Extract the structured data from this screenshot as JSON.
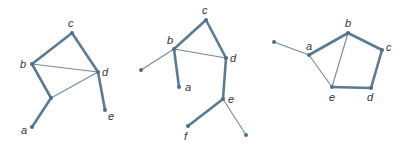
{
  "chart_data": {
    "type": "diagram",
    "graphs": [
      {
        "name": "graph-1",
        "nodes": [
          {
            "id": "a",
            "label": "a",
            "x": 32,
            "y": 127,
            "lx": 21,
            "ly": 134
          },
          {
            "id": "b",
            "label": "b",
            "x": 32,
            "y": 64,
            "lx": 20,
            "ly": 68
          },
          {
            "id": "c",
            "label": "c",
            "x": 72,
            "y": 33,
            "lx": 68,
            "ly": 27
          },
          {
            "id": "d",
            "label": "d",
            "x": 98,
            "y": 72,
            "lx": 102,
            "ly": 76
          },
          {
            "id": "e",
            "label": "e",
            "x": 105,
            "y": 110,
            "lx": 108,
            "ly": 120
          },
          {
            "id": "m",
            "label": "",
            "x": 51,
            "y": 98
          }
        ],
        "edges": [
          {
            "from": "a",
            "to": "m",
            "weight": "thick"
          },
          {
            "from": "m",
            "to": "b",
            "weight": "thick"
          },
          {
            "from": "b",
            "to": "c",
            "weight": "thick"
          },
          {
            "from": "c",
            "to": "d",
            "weight": "thick"
          },
          {
            "from": "d",
            "to": "e",
            "weight": "thick"
          },
          {
            "from": "b",
            "to": "d",
            "weight": "thin"
          },
          {
            "from": "m",
            "to": "d",
            "weight": "thin"
          }
        ]
      },
      {
        "name": "graph-2",
        "nodes": [
          {
            "id": "c",
            "label": "c",
            "x": 206,
            "y": 20,
            "lx": 202,
            "ly": 14
          },
          {
            "id": "b",
            "label": "b",
            "x": 174,
            "y": 49,
            "lx": 167,
            "ly": 44
          },
          {
            "id": "d",
            "label": "d",
            "x": 226,
            "y": 58,
            "lx": 230,
            "ly": 62
          },
          {
            "id": "l",
            "label": "",
            "x": 141,
            "y": 70
          },
          {
            "id": "a",
            "label": "a",
            "x": 179,
            "y": 87,
            "lx": 185,
            "ly": 91
          },
          {
            "id": "e",
            "label": "e",
            "x": 223,
            "y": 99,
            "lx": 228,
            "ly": 103
          },
          {
            "id": "f",
            "label": "f",
            "x": 188,
            "y": 126,
            "lx": 184,
            "ly": 140
          },
          {
            "id": "r",
            "label": "",
            "x": 246,
            "y": 135
          }
        ],
        "edges": [
          {
            "from": "b",
            "to": "c",
            "weight": "thick"
          },
          {
            "from": "c",
            "to": "d",
            "weight": "thick"
          },
          {
            "from": "b",
            "to": "a",
            "weight": "thick"
          },
          {
            "from": "d",
            "to": "e",
            "weight": "thick"
          },
          {
            "from": "e",
            "to": "f",
            "weight": "thick"
          },
          {
            "from": "b",
            "to": "d",
            "weight": "thin"
          },
          {
            "from": "b",
            "to": "l",
            "weight": "thin"
          },
          {
            "from": "e",
            "to": "r",
            "weight": "thin"
          }
        ]
      },
      {
        "name": "graph-3",
        "nodes": [
          {
            "id": "l",
            "label": "",
            "x": 274,
            "y": 42
          },
          {
            "id": "a",
            "label": "a",
            "x": 309,
            "y": 55,
            "lx": 306,
            "ly": 50
          },
          {
            "id": "b",
            "label": "b",
            "x": 348,
            "y": 33,
            "lx": 345,
            "ly": 27
          },
          {
            "id": "c",
            "label": "c",
            "x": 382,
            "y": 50,
            "lx": 386,
            "ly": 51
          },
          {
            "id": "d",
            "label": "d",
            "x": 371,
            "y": 88,
            "lx": 367,
            "ly": 101
          },
          {
            "id": "e",
            "label": "e",
            "x": 332,
            "y": 87,
            "lx": 329,
            "ly": 101
          }
        ],
        "edges": [
          {
            "from": "a",
            "to": "b",
            "weight": "thick"
          },
          {
            "from": "b",
            "to": "c",
            "weight": "thick"
          },
          {
            "from": "c",
            "to": "d",
            "weight": "thick"
          },
          {
            "from": "d",
            "to": "e",
            "weight": "thick"
          },
          {
            "from": "l",
            "to": "a",
            "weight": "thin"
          },
          {
            "from": "a",
            "to": "e",
            "weight": "thin"
          },
          {
            "from": "b",
            "to": "e",
            "weight": "thin"
          }
        ]
      }
    ],
    "colors": {
      "edge": "#5b7a93",
      "node": "#4f6f88",
      "label": "#333333"
    }
  }
}
